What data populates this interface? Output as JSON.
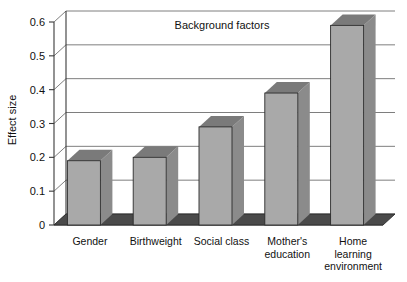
{
  "chart_data": {
    "type": "bar",
    "title": "Background  factors",
    "xlabel": "",
    "ylabel": "Effect size",
    "categories": [
      "Gender",
      "Birthweight",
      "Social class",
      "Mother's education",
      "Home learning environment"
    ],
    "category_lines": [
      [
        "Gender"
      ],
      [
        "Birthweight"
      ],
      [
        "Social class"
      ],
      [
        "Mother's",
        "education"
      ],
      [
        "Home",
        "learning",
        "environment"
      ]
    ],
    "values": [
      0.19,
      0.2,
      0.29,
      0.39,
      0.59
    ],
    "ylim": [
      0,
      0.6
    ],
    "ytick_values": [
      0,
      0.1,
      0.2,
      0.3,
      0.4,
      0.5,
      0.6
    ],
    "ytick_labels": [
      "0",
      "0.1",
      "0.2",
      "0.3",
      "0.4",
      "0.5",
      "0.6"
    ],
    "grid": true,
    "legend": "none",
    "style": "3d-column",
    "colors": {
      "bar_front": "#a9a9a9",
      "bar_side": "#8b8b8b",
      "bar_top": "#7a7a7a",
      "floor": "#4a4a4a",
      "gridline": "#6f6f6f",
      "axis": "#3a3a3a",
      "text": "#111111",
      "background": "#ffffff"
    }
  }
}
